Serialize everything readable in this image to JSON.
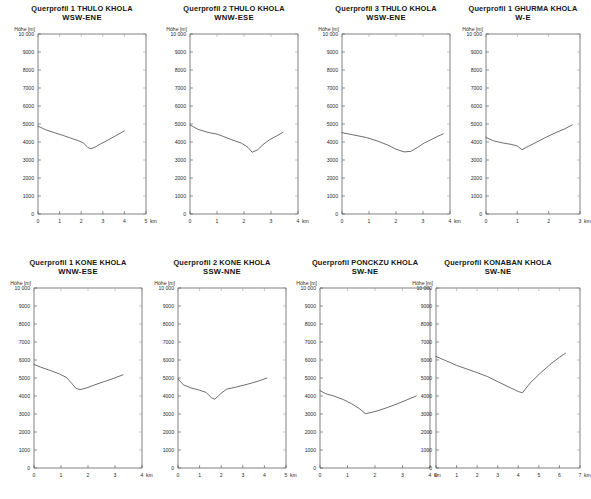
{
  "figure": {
    "y_axis_label": "Höhe [m]",
    "x_unit": "km",
    "y_ticks": [
      "0",
      "1000",
      "2000",
      "3000",
      "4000",
      "5000",
      "6000",
      "7000",
      "8000",
      "9000",
      "10 000"
    ],
    "y_values": [
      0,
      1000,
      2000,
      3000,
      4000,
      5000,
      6000,
      7000,
      8000,
      9000,
      10000
    ],
    "ylim": [
      0,
      10000
    ],
    "line_color": "#3d3d3d",
    "axis_color": "#4a4a4a",
    "background": "#ffffff"
  },
  "chart_data": [
    {
      "id": "thulo-1",
      "type": "line",
      "title": "Querprofil 1 THULO KHOLA",
      "subtitle": "WSW-ENE",
      "xlabel": "",
      "ylabel": "Höhe [m]",
      "x_unit": "km",
      "xlim": [
        0,
        5
      ],
      "ylim": [
        0,
        10000
      ],
      "x_ticks": [
        0,
        1,
        2,
        3,
        4,
        5
      ],
      "x_tick_labels": [
        "0",
        "1",
        "2",
        "3",
        "4",
        "5"
      ],
      "y_ticks": [
        0,
        1000,
        2000,
        3000,
        4000,
        5000,
        6000,
        7000,
        8000,
        9000,
        10000
      ],
      "grid": false,
      "legend": "none",
      "x": [
        0.0,
        0.35,
        0.75,
        1.1,
        1.5,
        1.85,
        2.1,
        2.3,
        2.45,
        2.65,
        2.9,
        3.2,
        3.6,
        4.0
      ],
      "y": [
        4880,
        4680,
        4520,
        4390,
        4220,
        4080,
        3950,
        3700,
        3620,
        3720,
        3900,
        4080,
        4350,
        4620
      ]
    },
    {
      "id": "thulo-2",
      "type": "line",
      "title": "Querprofil 2 THULO KHOLA",
      "subtitle": "WNW-ESE",
      "xlabel": "",
      "ylabel": "Höhe [m]",
      "x_unit": "km",
      "xlim": [
        0,
        4
      ],
      "ylim": [
        0,
        10000
      ],
      "x_ticks": [
        0,
        1,
        2,
        3,
        4
      ],
      "x_tick_labels": [
        "0",
        "1",
        "2",
        "3",
        "4"
      ],
      "y_ticks": [
        0,
        1000,
        2000,
        3000,
        4000,
        5000,
        6000,
        7000,
        8000,
        9000,
        10000
      ],
      "grid": false,
      "legend": "none",
      "x": [
        0.0,
        0.3,
        0.7,
        1.0,
        1.25,
        1.55,
        1.9,
        2.15,
        2.3,
        2.5,
        2.7,
        2.95,
        3.2,
        3.45
      ],
      "y": [
        4950,
        4700,
        4520,
        4440,
        4300,
        4120,
        3940,
        3700,
        3430,
        3560,
        3850,
        4130,
        4330,
        4540
      ]
    },
    {
      "id": "thulo-3",
      "type": "line",
      "title": "Querprofil 3 THULO KHOLA",
      "subtitle": "WSW-ENE",
      "xlabel": "",
      "ylabel": "Höhe [m]",
      "x_unit": "km",
      "xlim": [
        0,
        4
      ],
      "ylim": [
        0,
        10000
      ],
      "x_ticks": [
        0,
        1,
        2,
        3,
        4
      ],
      "x_tick_labels": [
        "0",
        "1",
        "2",
        "3",
        "4"
      ],
      "y_ticks": [
        0,
        1000,
        2000,
        3000,
        4000,
        5000,
        6000,
        7000,
        8000,
        9000,
        10000
      ],
      "grid": false,
      "legend": "none",
      "x": [
        0.0,
        0.4,
        0.9,
        1.3,
        1.7,
        2.0,
        2.3,
        2.55,
        2.8,
        3.05,
        3.3,
        3.55,
        3.75
      ],
      "y": [
        4520,
        4400,
        4250,
        4060,
        3830,
        3600,
        3450,
        3480,
        3700,
        3950,
        4130,
        4320,
        4450
      ]
    },
    {
      "id": "ghurma-1",
      "type": "line",
      "title": "Querprofil 1 GHURMA KHOLA",
      "subtitle": "W-E",
      "xlabel": "",
      "ylabel": "Höhe [m]",
      "x_unit": "km",
      "xlim": [
        0,
        3
      ],
      "ylim": [
        0,
        10000
      ],
      "x_ticks": [
        0,
        1,
        2,
        3
      ],
      "x_tick_labels": [
        "0",
        "1",
        "2",
        "3"
      ],
      "y_ticks": [
        0,
        1000,
        2000,
        3000,
        4000,
        5000,
        6000,
        7000,
        8000,
        9000,
        10000
      ],
      "grid": false,
      "legend": "none",
      "x": [
        0.0,
        0.25,
        0.55,
        0.8,
        1.0,
        1.15,
        1.35,
        1.6,
        1.9,
        2.2,
        2.5,
        2.75
      ],
      "y": [
        4250,
        4060,
        3940,
        3870,
        3780,
        3570,
        3760,
        3980,
        4250,
        4500,
        4720,
        4950
      ]
    },
    {
      "id": "kone-1",
      "type": "line",
      "title": "Querprofil 1 KONE KHOLA",
      "subtitle": "WNW-ESE",
      "xlabel": "",
      "ylabel": "Höhe [m]",
      "x_unit": "km",
      "xlim": [
        0,
        4
      ],
      "ylim": [
        0,
        10000
      ],
      "x_ticks": [
        0,
        1,
        2,
        3,
        4
      ],
      "x_tick_labels": [
        "0",
        "1",
        "2",
        "3",
        "4"
      ],
      "y_ticks": [
        0,
        1000,
        2000,
        3000,
        4000,
        5000,
        6000,
        7000,
        8000,
        9000,
        10000
      ],
      "grid": false,
      "legend": "none",
      "x": [
        0.0,
        0.25,
        0.6,
        0.95,
        1.2,
        1.4,
        1.55,
        1.7,
        1.95,
        2.25,
        2.6,
        2.95,
        3.3
      ],
      "y": [
        5750,
        5600,
        5420,
        5220,
        5030,
        4700,
        4430,
        4350,
        4450,
        4620,
        4800,
        4980,
        5180
      ]
    },
    {
      "id": "kone-2",
      "type": "line",
      "title": "Querprofil 2 KONE KHOLA",
      "subtitle": "SSW-NNE",
      "xlabel": "",
      "ylabel": "Höhe [m]",
      "x_unit": "km",
      "xlim": [
        0,
        5
      ],
      "ylim": [
        0,
        10000
      ],
      "x_ticks": [
        0,
        1,
        2,
        3,
        4,
        5
      ],
      "x_tick_labels": [
        "0",
        "1",
        "2",
        "3",
        "4",
        "5"
      ],
      "y_ticks": [
        0,
        1000,
        2000,
        3000,
        4000,
        5000,
        6000,
        7000,
        8000,
        9000,
        10000
      ],
      "grid": false,
      "legend": "none",
      "x": [
        0.0,
        0.25,
        0.6,
        1.0,
        1.3,
        1.55,
        1.7,
        2.0,
        2.25,
        2.7,
        3.2,
        3.7,
        4.1
      ],
      "y": [
        4950,
        4620,
        4450,
        4320,
        4200,
        3900,
        3820,
        4150,
        4380,
        4500,
        4650,
        4820,
        4990
      ]
    },
    {
      "id": "ponckzu",
      "type": "line",
      "title": "Querprofil PONCKZU KHOLA",
      "subtitle": "SW-NE",
      "xlabel": "",
      "ylabel": "Höhe [m]",
      "x_unit": "km",
      "xlim": [
        0,
        4
      ],
      "ylim": [
        0,
        10000
      ],
      "x_ticks": [
        0,
        1,
        2,
        3,
        4
      ],
      "x_tick_labels": [
        "0",
        "1",
        "2",
        "3",
        "4"
      ],
      "y_ticks": [
        0,
        1000,
        2000,
        3000,
        4000,
        5000,
        6000,
        7000,
        8000,
        9000,
        10000
      ],
      "grid": false,
      "legend": "none",
      "x": [
        0.0,
        0.2,
        0.5,
        0.85,
        1.15,
        1.45,
        1.65,
        1.85,
        2.1,
        2.45,
        2.8,
        3.15,
        3.5
      ],
      "y": [
        4300,
        4130,
        4000,
        3800,
        3570,
        3280,
        3020,
        3080,
        3180,
        3360,
        3560,
        3780,
        4000
      ]
    },
    {
      "id": "konaban",
      "type": "line",
      "title": "Querprofil KONABAN KHOLA",
      "subtitle": "SW-NE",
      "xlabel": "",
      "ylabel": "Höhe [m]",
      "x_unit": "km",
      "xlim": [
        0,
        7
      ],
      "ylim": [
        0,
        10000
      ],
      "x_ticks": [
        0,
        1,
        2,
        3,
        4,
        5,
        6,
        7
      ],
      "x_tick_labels": [
        "0",
        "1",
        "2",
        "3",
        "4",
        "5",
        "6",
        "7"
      ],
      "y_ticks": [
        0,
        1000,
        2000,
        3000,
        4000,
        5000,
        6000,
        7000,
        8000,
        9000,
        10000
      ],
      "grid": false,
      "legend": "none",
      "x": [
        0.0,
        0.5,
        1.0,
        1.5,
        2.0,
        2.5,
        3.0,
        3.5,
        4.0,
        4.2,
        4.6,
        5.1,
        5.6,
        6.0,
        6.3
      ],
      "y": [
        6200,
        5950,
        5700,
        5500,
        5300,
        5080,
        4800,
        4520,
        4250,
        4180,
        4750,
        5300,
        5800,
        6150,
        6380
      ]
    }
  ]
}
